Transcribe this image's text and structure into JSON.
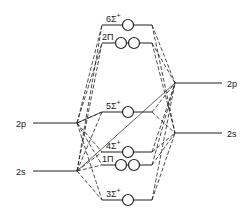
{
  "diagram": {
    "type": "molecular-orbital-diagram",
    "left_atom": {
      "levels": [
        {
          "id": "L2p",
          "label": "2p"
        },
        {
          "id": "L2s",
          "label": "2s"
        }
      ]
    },
    "right_atom": {
      "levels": [
        {
          "id": "R2p",
          "label": "2p"
        },
        {
          "id": "R2s",
          "label": "2s"
        }
      ]
    },
    "molecular_orbitals": [
      {
        "id": "6sigma",
        "label": "6Σ",
        "sup": "+",
        "orbitals": 1
      },
      {
        "id": "2pi",
        "label": "2Π",
        "sup": "",
        "orbitals": 2
      },
      {
        "id": "5sigma",
        "label": "5Σ",
        "sup": "+",
        "orbitals": 1
      },
      {
        "id": "4sigma",
        "label": "4Σ",
        "sup": "+",
        "orbitals": 1
      },
      {
        "id": "1pi",
        "label": "1Π",
        "sup": "",
        "orbitals": 2
      },
      {
        "id": "3sigma",
        "label": "3Σ",
        "sup": "+",
        "orbitals": 1
      }
    ],
    "line_color": "#222222"
  }
}
